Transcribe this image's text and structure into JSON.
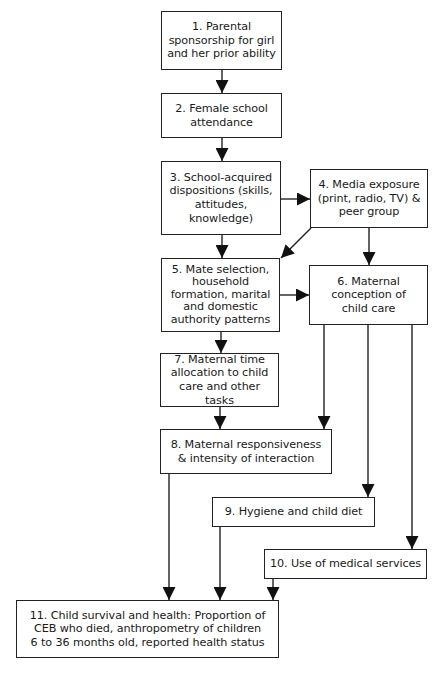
{
  "diagram": {
    "type": "flowchart",
    "nodes": [
      {
        "id": 1,
        "label": "1. Parental\nsponsorship for girl\nand her prior ability"
      },
      {
        "id": 2,
        "label": "2. Female school\nattendance"
      },
      {
        "id": 3,
        "label": "3. School-acquired\ndispositions (skills,\nattitudes,\nknowledge)"
      },
      {
        "id": 4,
        "label": "4. Media exposure\n(print, radio, TV) &\npeer group"
      },
      {
        "id": 5,
        "label": "5. Mate selection,\nhousehold\nformation, marital\nand domestic\nauthority patterns"
      },
      {
        "id": 6,
        "label": "6. Maternal\nconception of\nchild care"
      },
      {
        "id": 7,
        "label": "7. Maternal time\nallocation to child\ncare and other tasks"
      },
      {
        "id": 8,
        "label": "8. Maternal responsiveness\n& intensity of interaction"
      },
      {
        "id": 9,
        "label": "9. Hygiene and child diet"
      },
      {
        "id": 10,
        "label": "10. Use of medical services"
      },
      {
        "id": 11,
        "label": "11. Child survival and health: Proportion of\nCEB who died, anthropometry of children\n6 to 36 months old, reported health status"
      }
    ],
    "edges": [
      {
        "from": 1,
        "to": 2
      },
      {
        "from": 2,
        "to": 3
      },
      {
        "from": 3,
        "to": 4
      },
      {
        "from": 3,
        "to": 5
      },
      {
        "from": 4,
        "to": 5
      },
      {
        "from": 4,
        "to": 6
      },
      {
        "from": 5,
        "to": 6
      },
      {
        "from": 5,
        "to": 7
      },
      {
        "from": 6,
        "to": 8
      },
      {
        "from": 6,
        "to": 9
      },
      {
        "from": 6,
        "to": 10
      },
      {
        "from": 7,
        "to": 8
      },
      {
        "from": 8,
        "to": 11
      },
      {
        "from": 9,
        "to": 11
      },
      {
        "from": 10,
        "to": 11
      }
    ],
    "colors": {
      "stroke": "#222222",
      "background": "#ffffff",
      "text": "#1a1a1a"
    }
  }
}
